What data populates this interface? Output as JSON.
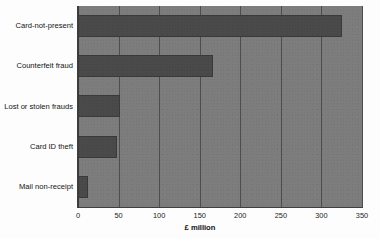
{
  "chart_data": {
    "type": "bar",
    "orientation": "horizontal",
    "title": "",
    "subtitle": "",
    "xlabel": "£ million",
    "ylabel": "",
    "categories": [
      "Card-not-present",
      "Counterfeit fraud",
      "Lost or stolen frauds",
      "Card ID theft",
      "Mail non-receipt"
    ],
    "values": [
      325,
      166,
      52,
      48,
      12
    ],
    "series": [
      {
        "name": "Fraud losses",
        "values": [
          325,
          166,
          52,
          48,
          12
        ]
      }
    ],
    "xlim": [
      0,
      350
    ],
    "ylim": [
      0,
      5
    ],
    "xticks": [
      0,
      50,
      100,
      150,
      200,
      250,
      300,
      350
    ],
    "xtick_labels": [
      "0",
      "50",
      "100",
      "150",
      "200",
      "250",
      "300",
      "350"
    ],
    "grid": true,
    "grid_axis": "x",
    "legend": false,
    "legend_position": "none",
    "annotations": [],
    "colors": {
      "bar": "#4a4a4a",
      "bar_edge": "#3a3a3a",
      "plot_background": "#7d7d7d",
      "figure_background": "#fdfdfd",
      "gridline": "#4d4d4d",
      "axis": "#3f3f3f",
      "text": "#111111"
    }
  }
}
